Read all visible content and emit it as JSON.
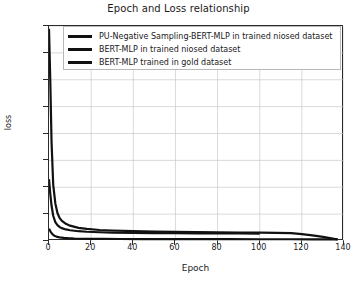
{
  "chart_data": {
    "type": "line",
    "title": "Epoch and Loss relationship",
    "xlabel": "Epoch",
    "ylabel": "loss",
    "xlim": [
      0,
      140
    ],
    "ylim": [
      0,
      4000
    ],
    "xticks": [
      0,
      20,
      40,
      60,
      80,
      100,
      120,
      140
    ],
    "yticks": [
      0,
      500,
      1000,
      1500,
      2000,
      2500,
      3000,
      3500,
      4000
    ],
    "grid": true,
    "legend_position": "upper right",
    "line_color": "#111111",
    "series": [
      {
        "name": "PU-Negative Sampling-BERT-MLP in trained niosed dataset",
        "x": [
          0,
          0.6,
          1.2,
          2,
          3,
          4,
          5,
          6,
          8,
          10,
          14,
          18,
          24,
          30,
          40,
          50,
          60,
          70,
          80,
          90,
          100,
          108,
          115,
          120,
          125,
          130,
          134,
          137
        ],
        "y": [
          3950,
          3000,
          1850,
          1050,
          700,
          520,
          430,
          380,
          320,
          285,
          245,
          225,
          205,
          195,
          182,
          176,
          170,
          166,
          162,
          158,
          155,
          150,
          145,
          128,
          105,
          78,
          48,
          28
        ]
      },
      {
        "name": "BERT-MLP in trained niosed dataset",
        "x": [
          0,
          0.6,
          1.2,
          2,
          3,
          4,
          5,
          6,
          8,
          10,
          14,
          18,
          24,
          30,
          40,
          50,
          60,
          70,
          80,
          90,
          100
        ],
        "y": [
          1150,
          880,
          660,
          470,
          350,
          295,
          262,
          240,
          215,
          200,
          182,
          172,
          163,
          157,
          150,
          147,
          144,
          142,
          141,
          140,
          139
        ]
      },
      {
        "name": "BERT-MLP trained in gold dataset",
        "x": [
          0,
          0.8,
          1.6,
          2.5,
          3.5,
          5,
          7,
          9,
          12,
          16,
          20,
          26,
          34,
          44,
          56,
          70,
          85,
          100,
          115,
          125,
          133,
          137
        ],
        "y": [
          230,
          170,
          128,
          100,
          82,
          68,
          58,
          52,
          46,
          42,
          40,
          38,
          37,
          36,
          35,
          34,
          34,
          33,
          33,
          32,
          32,
          32
        ]
      }
    ]
  }
}
